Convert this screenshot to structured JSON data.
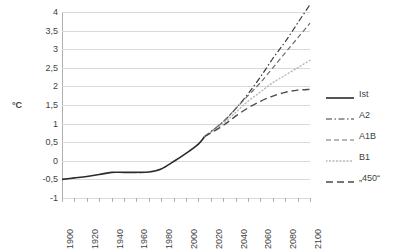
{
  "chart_data": {
    "type": "line",
    "title": "",
    "xlabel": "",
    "ylabel": "°C",
    "xlim": [
      1900,
      2100
    ],
    "ylim": [
      -1,
      4
    ],
    "grid": true,
    "legend_position": "right",
    "x_ticks": [
      1900,
      1920,
      1940,
      1960,
      1980,
      2000,
      2020,
      2040,
      2060,
      2080,
      2100
    ],
    "x_tick_labels": [
      "1900",
      "1920",
      "1940",
      "1960",
      "1980",
      "2000",
      "2020",
      "2040",
      "2060",
      "2080",
      "2100"
    ],
    "x_minor_ticks": [
      1900,
      1910,
      1920,
      1930,
      1940,
      1950,
      1960,
      1970,
      1980,
      1990,
      2000,
      2010,
      2020,
      2030,
      2040,
      2050,
      2060,
      2070,
      2080,
      2090,
      2100
    ],
    "y_ticks": [
      -1,
      -0.5,
      0,
      0.5,
      1,
      1.5,
      2,
      2.5,
      3,
      3.5,
      4
    ],
    "y_tick_labels": [
      "-1",
      "-0,5",
      "0",
      "0,5",
      "1",
      "1,5",
      "2",
      "2,5",
      "3",
      "3,5",
      "4"
    ],
    "series": [
      {
        "name": "Ist",
        "style": "solid",
        "color": "#2b2b2b",
        "width": 1.6,
        "x": [
          1900,
          1910,
          1920,
          1930,
          1940,
          1950,
          1960,
          1970,
          1980,
          1990,
          2000,
          2010,
          2015
        ],
        "values": [
          -0.5,
          -0.46,
          -0.42,
          -0.37,
          -0.31,
          -0.31,
          -0.31,
          -0.3,
          -0.22,
          -0.02,
          0.2,
          0.45,
          0.65
        ]
      },
      {
        "name": "A2",
        "style": "dash-dot",
        "color": "#3a3a3a",
        "width": 1.2,
        "x": [
          2015,
          2030,
          2040,
          2050,
          2060,
          2070,
          2080,
          2090,
          2100
        ],
        "values": [
          0.65,
          1.05,
          1.4,
          1.8,
          2.25,
          2.75,
          3.2,
          3.7,
          4.2
        ]
      },
      {
        "name": "A1B",
        "style": "dashed",
        "color": "#6e6e6e",
        "width": 1.2,
        "x": [
          2015,
          2030,
          2040,
          2050,
          2060,
          2070,
          2080,
          2090,
          2100
        ],
        "values": [
          0.65,
          1.05,
          1.4,
          1.75,
          2.1,
          2.5,
          2.9,
          3.3,
          3.7
        ]
      },
      {
        "name": "B1",
        "style": "dotted",
        "color": "#b5b5b5",
        "width": 1.4,
        "x": [
          2015,
          2030,
          2040,
          2050,
          2060,
          2070,
          2080,
          2090,
          2100
        ],
        "values": [
          0.65,
          1.0,
          1.3,
          1.6,
          1.85,
          2.1,
          2.3,
          2.5,
          2.7
        ]
      },
      {
        "name": "„450“",
        "style": "dashed-long",
        "color": "#4a4a4a",
        "width": 1.4,
        "x": [
          2015,
          2030,
          2040,
          2050,
          2060,
          2070,
          2080,
          2090,
          2100
        ],
        "values": [
          0.65,
          0.95,
          1.2,
          1.42,
          1.6,
          1.74,
          1.84,
          1.9,
          1.92
        ]
      }
    ]
  },
  "legend": {
    "items": [
      {
        "label": "Ist"
      },
      {
        "label": "A2"
      },
      {
        "label": "A1B"
      },
      {
        "label": "B1"
      },
      {
        "label": "„450“"
      }
    ]
  }
}
